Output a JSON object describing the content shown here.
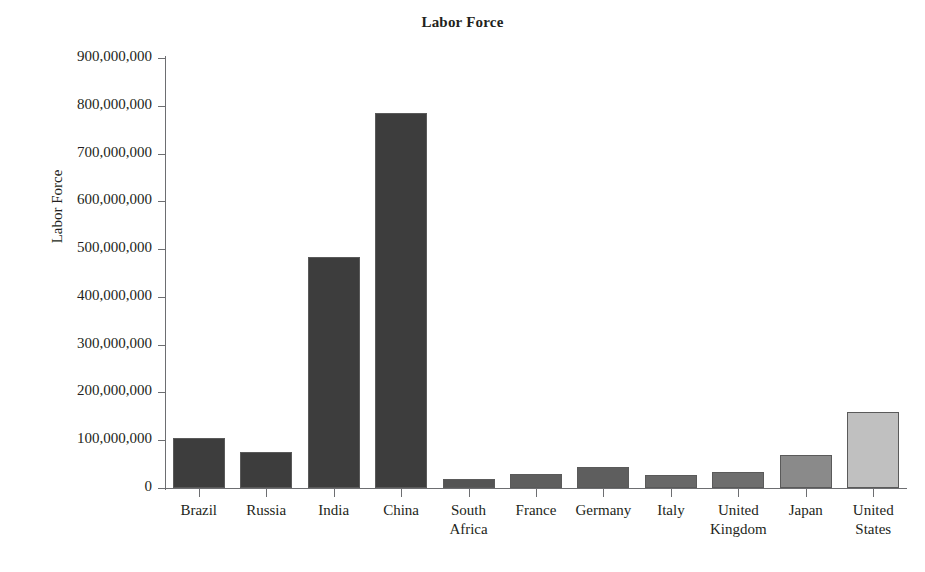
{
  "chart_data": {
    "type": "bar",
    "title": "Labor Force",
    "xlabel": "",
    "ylabel": "Labor Force",
    "ylim": [
      0,
      900000000
    ],
    "grid": false,
    "legend": "none",
    "categories": [
      "Brazil",
      "Russia",
      "India",
      "China",
      "South Africa",
      "France",
      "Germany",
      "Italy",
      "United Kingdom",
      "Japan",
      "United States"
    ],
    "values": [
      104000000,
      76000000,
      483000000,
      784000000,
      19000000,
      30000000,
      45000000,
      27000000,
      33000000,
      70000000,
      160000000
    ],
    "bar_colors": [
      "#3d3d3d",
      "#3d3d3d",
      "#3d3d3d",
      "#3d3d3d",
      "#545454",
      "#5e5e5e",
      "#5e5e5e",
      "#686868",
      "#6e6e6e",
      "#8a8a8a",
      "#c0c0c0"
    ],
    "bar_border_color": "#5a5a5a",
    "ytick_labels": [
      "0",
      "100,000,000",
      "200,000,000",
      "300,000,000",
      "400,000,000",
      "500,000,000",
      "600,000,000",
      "700,000,000",
      "800,000,000",
      "900,000,000"
    ],
    "ytick_values": [
      0,
      100000000,
      200000000,
      300000000,
      400000000,
      500000000,
      600000000,
      700000000,
      800000000,
      900000000
    ],
    "xtick_labels": [
      [
        "Brazil"
      ],
      [
        "Russia"
      ],
      [
        "India"
      ],
      [
        "China"
      ],
      [
        "South",
        "Africa"
      ],
      [
        "France"
      ],
      [
        "Germany"
      ],
      [
        "Italy"
      ],
      [
        "United",
        "Kingdom"
      ],
      [
        "Japan"
      ],
      [
        "United",
        "States"
      ]
    ],
    "axis_color": "#6d6e71",
    "text_color": "#231f20",
    "background": "#ffffff"
  }
}
